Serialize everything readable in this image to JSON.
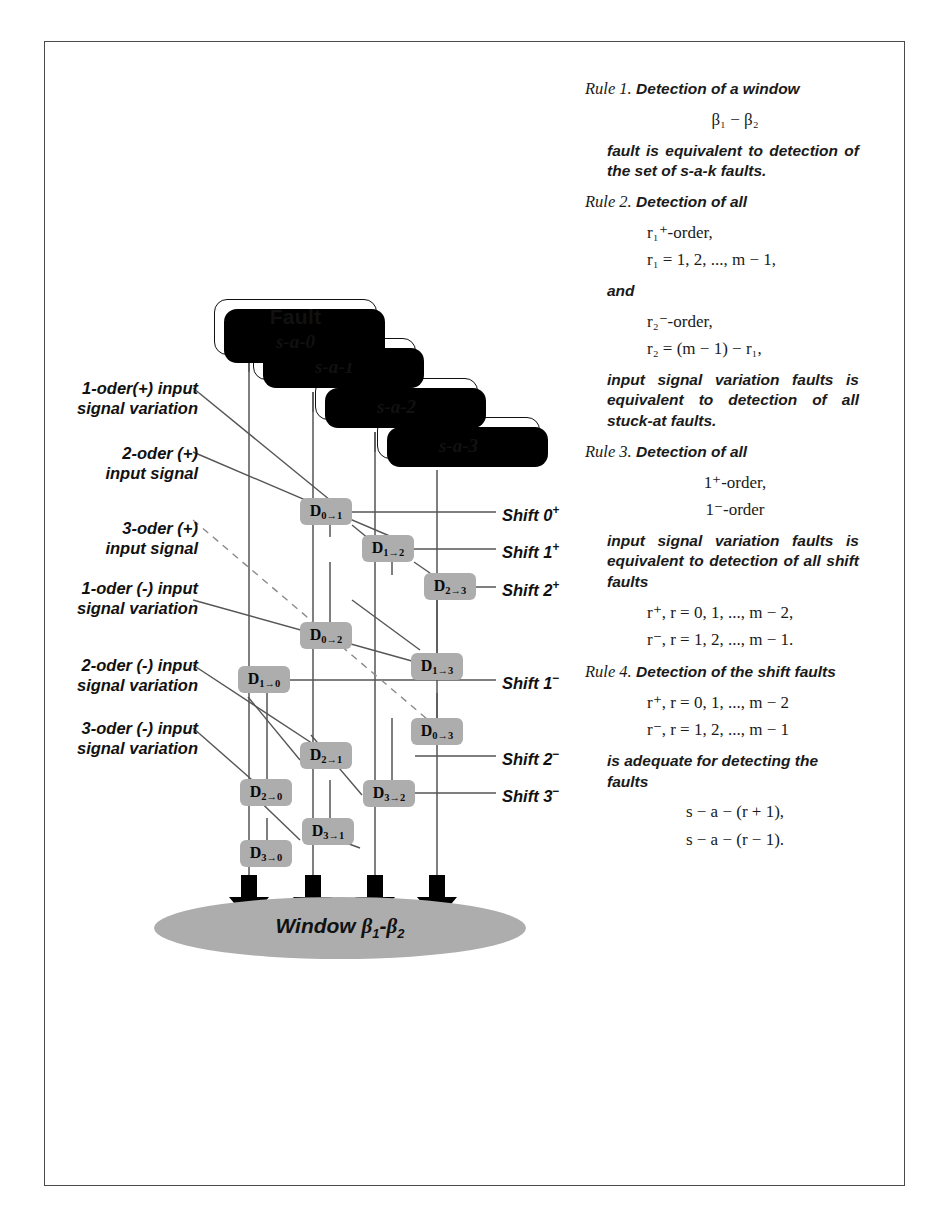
{
  "figure": {
    "type": "technical-diagram",
    "title_absent": true
  },
  "fault_stack": {
    "title": "Fault",
    "cards": [
      {
        "label": "s-a-0"
      },
      {
        "label": "s-a-1"
      },
      {
        "label": "s-a-2"
      },
      {
        "label": "s-a-3"
      }
    ]
  },
  "left_labels": [
    {
      "id": "l1",
      "text": "1-oder(+) input\nsignal variation"
    },
    {
      "id": "l2",
      "text": "2-oder (+)\ninput signal"
    },
    {
      "id": "l3",
      "text": "3-oder (+)\ninput signal"
    },
    {
      "id": "l4",
      "text": "1-oder (-) input\nsignal variation"
    },
    {
      "id": "l5",
      "text": "2-oder (-) input\nsignal variation"
    },
    {
      "id": "l6",
      "text": "3-oder (-) input\nsignal variation"
    }
  ],
  "delay_boxes": [
    {
      "id": "d01",
      "from": "0",
      "to": "1"
    },
    {
      "id": "d12",
      "from": "1",
      "to": "2"
    },
    {
      "id": "d23",
      "from": "2",
      "to": "3"
    },
    {
      "id": "d02",
      "from": "0",
      "to": "2"
    },
    {
      "id": "d13",
      "from": "1",
      "to": "3"
    },
    {
      "id": "d03",
      "from": "0",
      "to": "3"
    },
    {
      "id": "d10",
      "from": "1",
      "to": "0"
    },
    {
      "id": "d21",
      "from": "2",
      "to": "1"
    },
    {
      "id": "d20",
      "from": "2",
      "to": "0"
    },
    {
      "id": "d32",
      "from": "3",
      "to": "2"
    },
    {
      "id": "d31",
      "from": "3",
      "to": "1"
    },
    {
      "id": "d30",
      "from": "3",
      "to": "0"
    }
  ],
  "shift_labels": [
    {
      "id": "s0p",
      "name": "Shift 0",
      "sign": "+"
    },
    {
      "id": "s1p",
      "name": "Shift 1",
      "sign": "+"
    },
    {
      "id": "s2p",
      "name": "Shift 2",
      "sign": "+"
    },
    {
      "id": "s1m",
      "name": "Shift 1",
      "sign": "−"
    },
    {
      "id": "s2m",
      "name": "Shift 2",
      "sign": "−"
    },
    {
      "id": "s3m",
      "name": "Shift 3",
      "sign": "−"
    }
  ],
  "window_node": {
    "word": "Window",
    "beta1": "β",
    "sub1": "1",
    "dash": "-",
    "beta2": "β",
    "sub2": "2"
  },
  "rules": {
    "rule1": {
      "name": "Rule 1.",
      "head": "Detection of a window",
      "eq": "β₁ − β₂",
      "body": "fault is equivalent to detection of the set of s-a-k faults."
    },
    "rule2": {
      "name": "Rule 2.",
      "head": "Detection of all",
      "eq1a": "r₁⁺-order,",
      "eq1b": "r₁ = 1, 2, ..., m − 1,",
      "and": "and",
      "eq2a": "r₂⁻-order,",
      "eq2b": "r₂ = (m − 1) − r₁,",
      "body": "input signal variation faults is equivalent to detection of all stuck-at faults."
    },
    "rule3": {
      "name": "Rule 3.",
      "head": "Detection of all",
      "eq1": "1⁺-order,",
      "eq2": "1⁻-order",
      "body": "input signal variation faults is equivalent to detection of all shift faults",
      "eq3": "r⁺, r = 0, 1, ..., m − 2,",
      "eq4": "r⁻, r = 1, 2, ..., m − 1."
    },
    "rule4": {
      "name": "Rule 4.",
      "head": "Detection of the shift faults",
      "eq1": "r⁺, r = 0, 1, ..., m − 2",
      "eq2": "r⁻, r = 1, 2, ..., m − 1",
      "body": "is adequate for detecting the faults",
      "eq3": "s − a − (r + 1),",
      "eq4": "s − a − (r − 1)."
    }
  },
  "colors": {
    "box_gray": "#adadad",
    "line": "#555555",
    "border": "#4a4a4a",
    "ink": "#111111"
  }
}
